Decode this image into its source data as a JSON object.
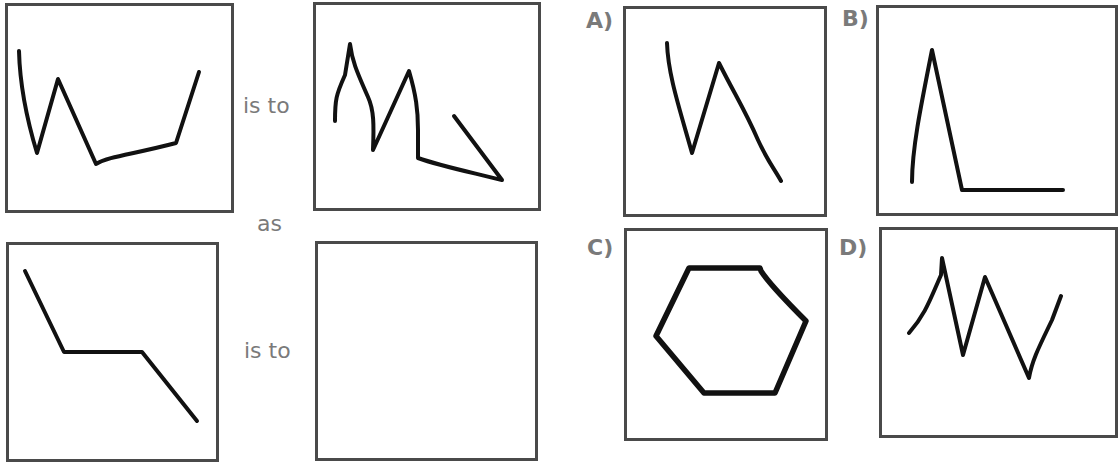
{
  "question": {
    "connector_is_to_top": "is to",
    "connector_as": "as",
    "connector_is_to_bottom": "is to",
    "answer_box": ""
  },
  "options": [
    {
      "label": "A)",
      "shape": "zigzag-line-descending"
    },
    {
      "label": "B)",
      "shape": "peak-then-flat-line"
    },
    {
      "label": "C)",
      "shape": "hexagon"
    },
    {
      "label": "D)",
      "shape": "double-zigzag-line"
    }
  ]
}
